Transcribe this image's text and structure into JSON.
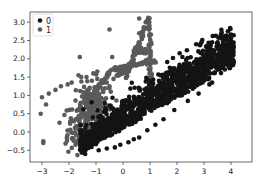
{
  "chart_data": {
    "type": "scatter",
    "title": "",
    "xlabel": "",
    "ylabel": "",
    "xlim": [
      -3.5,
      4.8
    ],
    "ylim": [
      -0.82,
      3.27
    ],
    "x_ticks": [
      -3,
      -2,
      -1,
      0,
      1,
      2,
      3,
      4
    ],
    "y_ticks": [
      -0.5,
      0.0,
      0.5,
      1.0,
      1.5,
      2.0,
      2.5,
      3.0
    ],
    "x_tick_labels": [
      "−3",
      "−2",
      "−1",
      "0",
      "1",
      "2",
      "3",
      "4"
    ],
    "y_tick_labels": [
      "−0.5",
      "0.0",
      "0.5",
      "1.0",
      "1.5",
      "2.0",
      "2.5",
      "3.0"
    ],
    "grid": false,
    "legend_position": "upper left",
    "legend": [
      {
        "label": "0",
        "color": "#141414"
      },
      {
        "label": "1",
        "color": "#5a5a5a"
      }
    ],
    "series": [
      {
        "name": "0",
        "color": "#141414",
        "description": "dense cluster along upward diagonal band from about (-1.5,-0.5) to (4,2.2)",
        "cluster": {
          "x_range": [
            -1.6,
            4.1
          ],
          "slope": 0.47,
          "intercept": 0.33,
          "spread": 0.55,
          "count": 1400
        },
        "points": [
          [
            3.5,
            2.4
          ],
          [
            3.6,
            2.05
          ],
          [
            3.7,
            1.95
          ],
          [
            3.9,
            2.0
          ],
          [
            4.1,
            1.9
          ],
          [
            2.1,
            2.15
          ],
          [
            2.2,
            2.05
          ],
          [
            3.0,
            1.55
          ],
          [
            3.2,
            1.3
          ],
          [
            3.1,
            1.45
          ],
          [
            -0.6,
            -0.45
          ],
          [
            -1.4,
            -0.6
          ],
          [
            -0.1,
            -0.35
          ],
          [
            0.4,
            -0.2
          ],
          [
            0.9,
            0.05
          ],
          [
            1.5,
            0.35
          ],
          [
            1.9,
            0.6
          ],
          [
            2.4,
            0.85
          ],
          [
            2.8,
            1.05
          ],
          [
            3.3,
            1.35
          ],
          [
            0.6,
            -0.15
          ],
          [
            1.2,
            0.2
          ],
          [
            -0.9,
            -0.5
          ],
          [
            -0.3,
            -0.42
          ],
          [
            0.2,
            -0.28
          ]
        ]
      },
      {
        "name": "1",
        "color": "#5a5a5a",
        "description": "left cluster around (-1.5,0.3) plus an 'A'-shaped ridge peaking near (0.9,3.1) and scattered outliers",
        "cluster": {
          "center": [
            -1.3,
            0.45
          ],
          "spread": 0.45,
          "count": 260
        },
        "points": [
          [
            -0.5,
            2.8
          ],
          [
            0.6,
            3.1
          ],
          [
            0.6,
            2.7
          ],
          [
            -1.6,
            2.05
          ],
          [
            -0.4,
            2.05
          ],
          [
            -0.95,
            1.65
          ],
          [
            -1.1,
            1.6
          ],
          [
            -0.5,
            1.65
          ],
          [
            -1.65,
            1.55
          ],
          [
            -1.55,
            1.5
          ],
          [
            -1.35,
            1.5
          ],
          [
            -1.15,
            1.4
          ],
          [
            -0.95,
            1.45
          ],
          [
            -1.9,
            1.35
          ],
          [
            -2.3,
            1.25
          ],
          [
            -2.05,
            1.3
          ],
          [
            -2.5,
            1.15
          ],
          [
            -2.75,
            1.05
          ],
          [
            -3.0,
            0.95
          ],
          [
            -2.85,
            0.75
          ],
          [
            -3.05,
            0.5
          ],
          [
            -2.35,
            0.25
          ],
          [
            -2.95,
            -0.25
          ],
          [
            -2.95,
            -0.3
          ],
          [
            -0.5,
            1.25
          ],
          [
            -0.45,
            1.1
          ],
          [
            -0.35,
            1.45
          ],
          [
            -0.6,
            1.35
          ]
        ],
        "ridge_segments": [
          [
            [
              0.1,
              1.5
            ],
            [
              0.95,
              3.1
            ]
          ],
          [
            [
              0.95,
              3.1
            ],
            [
              1.05,
              1.2
            ]
          ],
          [
            [
              0.4,
              2.2
            ],
            [
              0.85,
              2.2
            ]
          ],
          [
            [
              -0.4,
              1.7
            ],
            [
              1.2,
              1.95
            ]
          ],
          [
            [
              -0.2,
              1.55
            ],
            [
              0.3,
              1.8
            ]
          ],
          [
            [
              -1.3,
              0.9
            ],
            [
              -0.5,
              1.6
            ]
          ]
        ]
      }
    ]
  }
}
